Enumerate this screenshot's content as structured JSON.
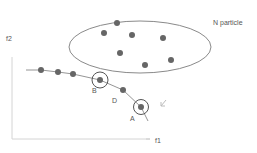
{
  "diagram": {
    "cluster_label": "N particle",
    "axis_x_label": "f1",
    "axis_y_label": "f2",
    "point_labels": {
      "a": "A",
      "b": "B",
      "d": "D"
    },
    "colors": {
      "point": "#666666",
      "line": "#777777",
      "ellipse": "#888888",
      "axis": "#cccccc",
      "text": "#555555"
    },
    "cluster_points": [
      [
        117,
        23
      ],
      [
        104,
        33
      ],
      [
        132,
        35
      ],
      [
        163,
        38
      ],
      [
        120,
        53
      ],
      [
        171,
        60
      ],
      [
        145,
        65
      ]
    ],
    "curve_points": [
      [
        41,
        70
      ],
      [
        58,
        72
      ],
      [
        73,
        74
      ],
      [
        100,
        80
      ],
      [
        123,
        90
      ],
      [
        141,
        107
      ]
    ],
    "circled_points": [
      [
        100,
        80
      ],
      [
        141,
        107
      ]
    ]
  }
}
